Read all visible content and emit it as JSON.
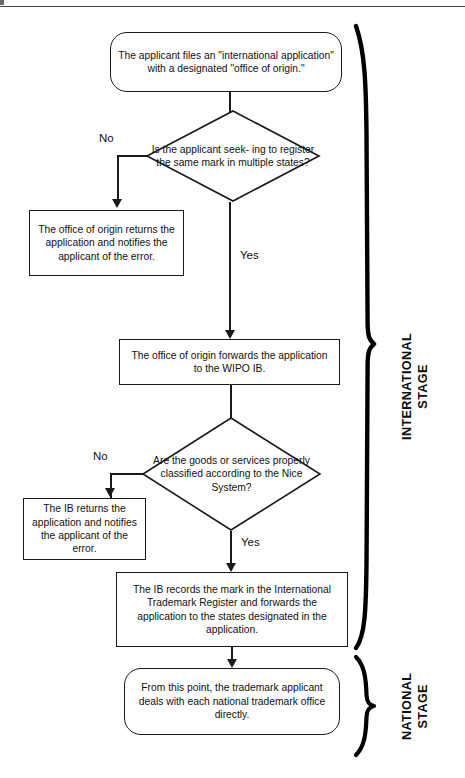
{
  "page": {
    "header_fragment": "FLOWCHART",
    "width": 465,
    "height": 778,
    "ink_color": "#1a1a1a",
    "background": "#ffffff"
  },
  "nodes": {
    "start": {
      "shape": "rounded-rectangle",
      "text": "The applicant files an \"international application\" with a designated \"office of origin.\""
    },
    "decision_multiple_states": {
      "shape": "diamond",
      "text": "Is the applicant seek- ing to register the same mark in  multiple states?"
    },
    "office_returns_error": {
      "shape": "rectangle",
      "text": "The office of origin returns the application and notifies the applicant of the error."
    },
    "office_forwards_wipo": {
      "shape": "rectangle",
      "text": "The office of origin forwards the application to the WIPO IB."
    },
    "decision_nice_classification": {
      "shape": "diamond",
      "text": "Are the goods or services properly classified according to the Nice System?"
    },
    "ib_returns_error": {
      "shape": "rectangle",
      "text": "The IB returns the application and notifies the applicant of the error."
    },
    "ib_records_mark": {
      "shape": "rectangle",
      "text": "The IB records the mark in the International Trademark Register and forwards the application to the states designated in the application."
    },
    "national_stage_end": {
      "shape": "rounded-rectangle",
      "text": "From this point, the trademark applicant deals with each national trademark office directly."
    }
  },
  "edge_labels": {
    "no_1": "No",
    "yes_1": "Yes",
    "no_2": "No",
    "yes_2": "Yes"
  },
  "stages": {
    "international": {
      "line1": "INTERNATIONAL",
      "line2": "STAGE"
    },
    "national": {
      "line1": "NATIONAL",
      "line2": "STAGE"
    }
  }
}
